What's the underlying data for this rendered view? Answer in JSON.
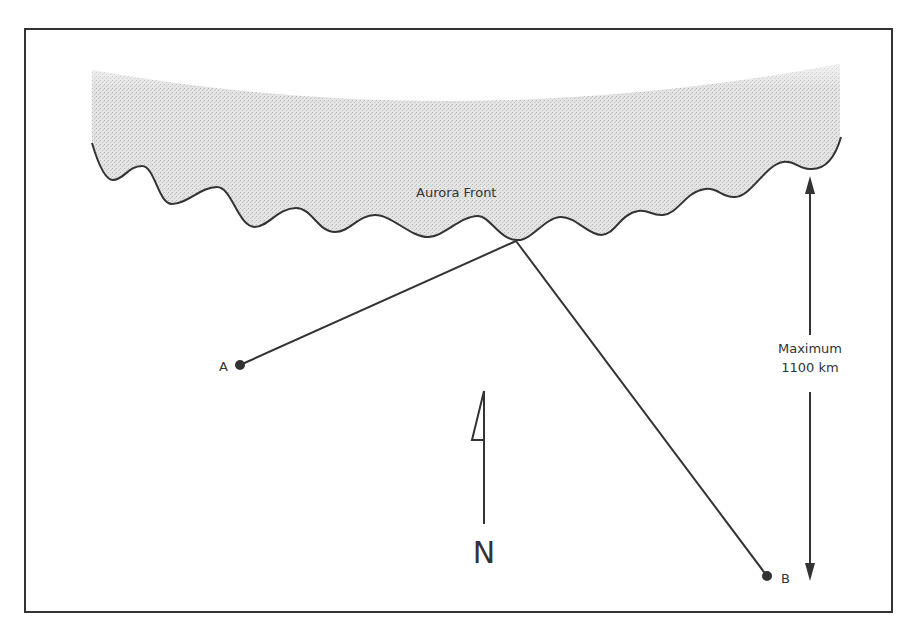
{
  "diagram": {
    "title": "",
    "aurora": {
      "label": "Aurora Front",
      "fill_color": "#dcdcdc",
      "edge_color": "#333333"
    },
    "points": {
      "a": {
        "label": "A"
      },
      "b": {
        "label": "B"
      }
    },
    "distance": {
      "line1": "Maximum",
      "line2": "1100 km"
    },
    "north": {
      "label": "N"
    },
    "colors": {
      "ink": "#333333",
      "border": "#333333",
      "background": "#ffffff"
    }
  }
}
